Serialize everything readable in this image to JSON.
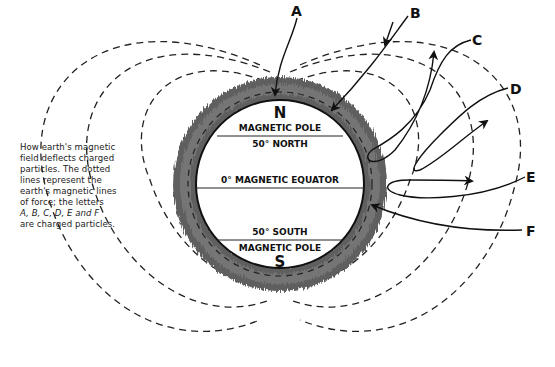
{
  "diagram": {
    "type": "earth-magnetic-field-particle-deflection",
    "caption_lines": [
      "How earth's magnetic",
      "field deflects charged",
      "particles. The dotted",
      "lines represent the",
      "earth's magnetic lines",
      "of force; the letters",
      "A, B, C, D, E and F",
      "are charged particles."
    ],
    "earth": {
      "north_pole_letter": "N",
      "north_pole_label": "MAGNETIC POLE",
      "north_latitude_label": "50° NORTH",
      "equator_label": "0° MAGNETIC EQUATOR",
      "south_latitude_label": "50° SOUTH",
      "south_pole_label": "MAGNETIC POLE",
      "south_pole_letter": "S"
    },
    "particles": [
      {
        "id": "A",
        "label": "A"
      },
      {
        "id": "B",
        "label": "B"
      },
      {
        "id": "C",
        "label": "C"
      },
      {
        "id": "D",
        "label": "D"
      },
      {
        "id": "E",
        "label": "E"
      },
      {
        "id": "F",
        "label": "F"
      }
    ],
    "colors": {
      "ink": "#111111",
      "ring": "#6a6a6a",
      "background": "#ffffff"
    }
  }
}
